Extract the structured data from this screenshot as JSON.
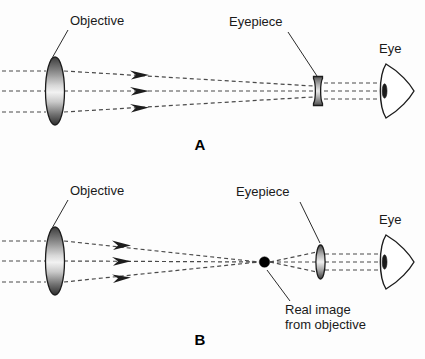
{
  "figure": {
    "background_color": "#fdfdfd",
    "ray_color": "#4a4a4a",
    "outline_color": "#1c1c1c",
    "text_color": "#1a1a1a"
  },
  "panels": [
    {
      "id": "A",
      "letter": "A",
      "description": "Galilean arrangement: converging objective with a diverging (biconcave) eyepiece placed before the focus.",
      "labels": {
        "objective": "Objective",
        "eyepiece": "Eyepiece",
        "eye": "Eye"
      },
      "elements": {
        "objective_type": "biconvex-lens",
        "eyepiece_type": "biconcave-lens",
        "eye_type": "eye-wedge",
        "ray_count": 3,
        "ray_style": "dashed",
        "arrowhead_count": 3
      }
    },
    {
      "id": "B",
      "letter": "B",
      "description": "Keplerian arrangement: converging objective forms a real image, then a converging eyepiece.",
      "labels": {
        "objective": "Objective",
        "eyepiece": "Eyepiece",
        "eye": "Eye",
        "real_image_line1": "Real image",
        "real_image_line2": "from objective"
      },
      "elements": {
        "objective_type": "biconvex-lens",
        "eyepiece_type": "biconvex-lens",
        "eye_type": "eye-wedge",
        "focus_marker": "filled-dot",
        "ray_count": 3,
        "ray_style": "dashed",
        "arrowhead_count": 3
      }
    }
  ]
}
